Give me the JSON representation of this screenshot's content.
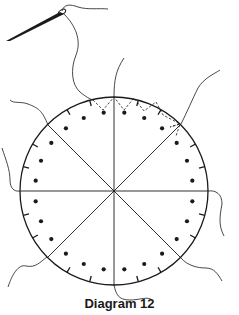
{
  "caption": "Diagram 12",
  "diagram": {
    "circle": {
      "cx": 114,
      "cy": 191,
      "r": 94
    },
    "sections": 8,
    "dots_per_section": 3,
    "ticks_per_section": 2,
    "stroke_color": "#1a1a1a",
    "elements": [
      "needle-icon",
      "thread",
      "circle-outline",
      "section-dividers",
      "dots",
      "tick-marks",
      "dashed-stitch-path"
    ]
  }
}
